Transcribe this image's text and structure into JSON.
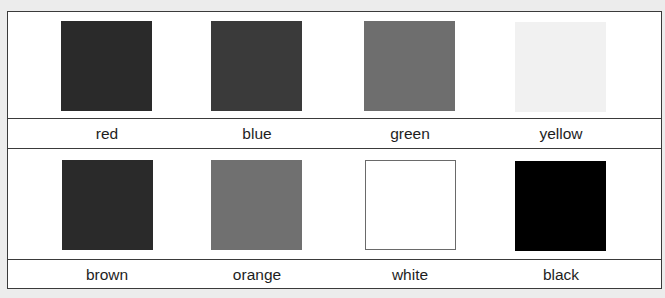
{
  "rows": [
    {
      "items": [
        {
          "label": "red",
          "swatch_color": "#2a2a2a"
        },
        {
          "label": "blue",
          "swatch_color": "#3a3a3a"
        },
        {
          "label": "green",
          "swatch_color": "#6e6e6e"
        },
        {
          "label": "yellow",
          "swatch_color": "#f1f1f1"
        }
      ]
    },
    {
      "items": [
        {
          "label": "brown",
          "swatch_color": "#2a2a2a"
        },
        {
          "label": "orange",
          "swatch_color": "#707070"
        },
        {
          "label": "white",
          "swatch_color": "#ffffff"
        },
        {
          "label": "black",
          "swatch_color": "#000000"
        }
      ]
    }
  ],
  "colors": {
    "page_background": "#ececec",
    "panel_background": "#ffffff",
    "border": "#3a3a3a",
    "text": "#1e1e1e"
  }
}
